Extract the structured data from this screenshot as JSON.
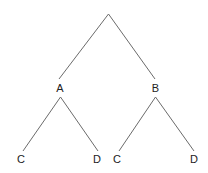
{
  "diagram": {
    "type": "tree",
    "nodes": [
      {
        "id": "root",
        "label": "",
        "x": 108.5,
        "y": 14
      },
      {
        "id": "A",
        "label": "A",
        "x": 60,
        "y": 92
      },
      {
        "id": "B",
        "label": "B",
        "x": 155.5,
        "y": 92
      },
      {
        "id": "A-C",
        "label": "C",
        "x": 21,
        "y": 163
      },
      {
        "id": "A-D",
        "label": "D",
        "x": 97,
        "y": 163
      },
      {
        "id": "B-C",
        "label": "C",
        "x": 117,
        "y": 163
      },
      {
        "id": "B-D",
        "label": "D",
        "x": 194,
        "y": 163
      }
    ],
    "edges": [
      {
        "from": "root",
        "to": "A",
        "x1": 108.5,
        "y1": 14,
        "x2": 59,
        "y2": 79
      },
      {
        "from": "root",
        "to": "B",
        "x1": 108.5,
        "y1": 14,
        "x2": 155,
        "y2": 79
      },
      {
        "from": "A",
        "to": "A-C",
        "x1": 60.5,
        "y1": 97,
        "x2": 23,
        "y2": 151
      },
      {
        "from": "A",
        "to": "A-D",
        "x1": 60.5,
        "y1": 97,
        "x2": 98,
        "y2": 151
      },
      {
        "from": "B",
        "to": "B-C",
        "x1": 155.5,
        "y1": 97,
        "x2": 119,
        "y2": 151
      },
      {
        "from": "B",
        "to": "B-D",
        "x1": 155.5,
        "y1": 97,
        "x2": 194,
        "y2": 151
      }
    ],
    "colors": {
      "edge": "#6b6b6b",
      "label": "#222222",
      "background": "#ffffff"
    }
  }
}
